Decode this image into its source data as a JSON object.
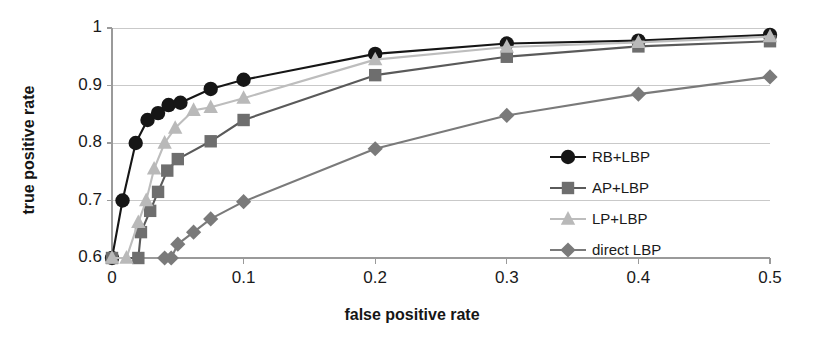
{
  "chart_data": {
    "type": "line",
    "title": "",
    "xlabel": "false positive rate",
    "ylabel": "true positive rate",
    "xlim": [
      0,
      0.5
    ],
    "ylim": [
      0.6,
      1
    ],
    "xticks": [
      "0",
      "0.1",
      "0.2",
      "0.3",
      "0.4",
      "0.5"
    ],
    "xtick_values": [
      0,
      0.1,
      0.2,
      0.3,
      0.4,
      0.5
    ],
    "yticks": [
      "0.6",
      "0.7",
      "0.8",
      "0.9",
      "1"
    ],
    "ytick_values": [
      0.6,
      0.7,
      0.8,
      0.9,
      1.0
    ],
    "grid": "horizontal",
    "legend_position": "center-right-inside",
    "series": [
      {
        "name": "RB+LBP",
        "marker": "circle",
        "color": "#161616",
        "line_color": "#161616",
        "x": [
          0.0,
          0.008,
          0.018,
          0.027,
          0.035,
          0.043,
          0.052,
          0.075,
          0.1,
          0.2,
          0.3,
          0.4,
          0.5
        ],
        "y": [
          0.6,
          0.7,
          0.8,
          0.84,
          0.852,
          0.866,
          0.87,
          0.894,
          0.91,
          0.955,
          0.973,
          0.978,
          0.988
        ]
      },
      {
        "name": "AP+LBP",
        "marker": "square",
        "color": "#6e6e6e",
        "line_color": "#5a5a5a",
        "x": [
          0.0,
          0.02,
          0.022,
          0.029,
          0.035,
          0.042,
          0.05,
          0.075,
          0.1,
          0.2,
          0.3,
          0.4,
          0.5
        ],
        "y": [
          0.6,
          0.6,
          0.645,
          0.682,
          0.715,
          0.752,
          0.772,
          0.803,
          0.84,
          0.918,
          0.95,
          0.968,
          0.977
        ]
      },
      {
        "name": "LP+LBP",
        "marker": "triangle",
        "color": "#b9b9b9",
        "line_color": "#bdbdbd",
        "x": [
          0.0,
          0.011,
          0.02,
          0.026,
          0.032,
          0.04,
          0.048,
          0.062,
          0.075,
          0.1,
          0.2,
          0.3,
          0.4,
          0.5
        ],
        "y": [
          0.6,
          0.6,
          0.662,
          0.7,
          0.755,
          0.8,
          0.826,
          0.857,
          0.862,
          0.878,
          0.945,
          0.967,
          0.975,
          0.985
        ]
      },
      {
        "name": "direct LBP",
        "marker": "diamond",
        "color": "#7a7a7a",
        "line_color": "#7a7a7a",
        "x": [
          0.04,
          0.045,
          0.05,
          0.062,
          0.075,
          0.1,
          0.2,
          0.3,
          0.4,
          0.5
        ],
        "y": [
          0.6,
          0.6,
          0.624,
          0.645,
          0.668,
          0.698,
          0.79,
          0.848,
          0.885,
          0.915
        ]
      }
    ]
  },
  "legend": {
    "items": [
      {
        "label": "RB+LBP"
      },
      {
        "label": "AP+LBP"
      },
      {
        "label": "LP+LBP"
      },
      {
        "label": "direct LBP"
      }
    ]
  },
  "colors": {
    "axis": "#9a9a9a",
    "grid": "#c9c9c9",
    "text": "#1a1a1a",
    "background": "#ffffff"
  }
}
